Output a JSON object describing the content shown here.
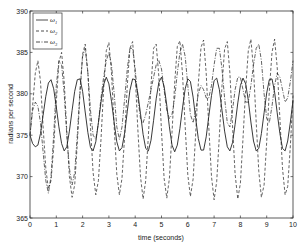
{
  "chart_data": {
    "type": "line",
    "title": "",
    "xlabel": "time (seconds)",
    "ylabel": "radians per second",
    "xlim": [
      0,
      10
    ],
    "ylim": [
      365,
      390
    ],
    "xticks": [
      0,
      1,
      2,
      3,
      4,
      5,
      6,
      7,
      8,
      9,
      10
    ],
    "yticks": [
      365,
      370,
      375,
      380,
      385,
      390
    ],
    "grid": false,
    "legend_position": "upper left",
    "x": [
      0.0,
      0.1,
      0.2,
      0.3,
      0.4,
      0.5,
      0.6,
      0.7,
      0.8,
      0.9,
      1.0,
      1.1,
      1.2,
      1.3,
      1.4,
      1.5,
      1.6,
      1.7,
      1.8,
      1.9,
      2.0,
      2.1,
      2.2,
      2.3,
      2.4,
      2.5,
      2.6,
      2.7,
      2.8,
      2.9,
      3.0,
      3.1,
      3.2,
      3.3,
      3.4,
      3.5,
      3.6,
      3.7,
      3.8,
      3.9,
      4.0,
      4.1,
      4.2,
      4.3,
      4.4,
      4.5,
      4.6,
      4.7,
      4.8,
      4.9,
      5.0,
      5.1,
      5.2,
      5.3,
      5.4,
      5.5,
      5.6,
      5.7,
      5.8,
      5.9,
      6.0,
      6.1,
      6.2,
      6.3,
      6.4,
      6.5,
      6.6,
      6.7,
      6.8,
      6.9,
      7.0,
      7.1,
      7.2,
      7.3,
      7.4,
      7.5,
      7.6,
      7.7,
      7.8,
      7.9,
      8.0,
      8.1,
      8.2,
      8.3,
      8.4,
      8.5,
      8.6,
      8.7,
      8.8,
      8.9,
      9.0,
      9.1,
      9.2,
      9.3,
      9.4,
      9.5,
      9.6,
      9.7,
      9.8,
      9.9,
      10.0
    ],
    "series": [
      {
        "name": "ω1",
        "style": "solid",
        "values": [
          375.0,
          374.0,
          373.6,
          373.8,
          375.2,
          377.4,
          379.7,
          381.3,
          381.7,
          380.6,
          378.4,
          376.0,
          374.0,
          373.1,
          373.6,
          375.5,
          378.0,
          380.3,
          381.7,
          381.8,
          380.3,
          377.8,
          375.3,
          373.5,
          373.1,
          374.2,
          376.5,
          379.0,
          381.1,
          382.0,
          381.2,
          379.1,
          376.5,
          374.2,
          373.1,
          373.5,
          375.3,
          377.9,
          380.4,
          381.8,
          381.7,
          380.1,
          377.6,
          375.1,
          373.4,
          373.1,
          374.4,
          376.8,
          379.4,
          381.4,
          382.0,
          380.9,
          378.6,
          376.0,
          373.8,
          373.0,
          373.8,
          375.8,
          378.3,
          380.6,
          381.8,
          381.5,
          379.6,
          377.0,
          374.6,
          373.2,
          373.2,
          374.8,
          377.3,
          379.8,
          381.6,
          381.9,
          380.5,
          378.0,
          375.5,
          373.6,
          373.1,
          374.1,
          376.3,
          378.9,
          381.0,
          381.9,
          381.2,
          379.2,
          376.6,
          374.3,
          373.1,
          373.4,
          375.2,
          377.7,
          380.1,
          381.7,
          381.8,
          380.2,
          377.7,
          375.2,
          373.4,
          373.1,
          374.3,
          376.6,
          379.2
        ]
      },
      {
        "name": "ω2",
        "style": "dashed",
        "values": [
          375.0,
          378.5,
          382.5,
          384.0,
          381.5,
          376.0,
          371.0,
          368.5,
          369.5,
          373.5,
          379.0,
          383.8,
          385.0,
          381.5,
          375.5,
          370.0,
          367.5,
          369.0,
          374.0,
          380.0,
          384.8,
          386.0,
          382.5,
          376.0,
          370.5,
          367.8,
          369.5,
          374.5,
          380.5,
          385.2,
          386.2,
          382.5,
          376.0,
          370.3,
          367.8,
          369.8,
          375.0,
          381.0,
          385.5,
          386.3,
          382.3,
          375.8,
          370.0,
          367.3,
          369.5,
          375.0,
          381.0,
          385.5,
          386.0,
          382.0,
          375.5,
          369.8,
          367.4,
          369.8,
          375.3,
          381.3,
          385.7,
          386.4,
          382.4,
          376.0,
          370.2,
          367.6,
          369.7,
          375.2,
          381.2,
          385.6,
          386.5,
          382.5,
          376.0,
          370.0,
          367.2,
          369.4,
          375.0,
          381.0,
          385.4,
          386.3,
          382.5,
          376.2,
          370.3,
          367.3,
          369.2,
          374.6,
          380.6,
          385.2,
          386.6,
          383.0,
          376.6,
          370.6,
          367.5,
          369.0,
          374.2,
          380.3,
          385.0,
          386.6,
          383.2,
          377.0,
          371.0,
          367.8,
          368.8,
          373.8,
          379.8
        ]
      },
      {
        "name": "ω3",
        "style": "dashdot",
        "values": [
          375.0,
          378.0,
          379.0,
          378.5,
          376.5,
          373.0,
          369.5,
          368.0,
          370.0,
          375.0,
          381.0,
          384.0,
          383.5,
          380.0,
          375.0,
          371.0,
          369.0,
          370.5,
          375.0,
          380.5,
          384.5,
          385.5,
          382.5,
          378.0,
          375.0,
          374.5,
          376.5,
          379.5,
          382.0,
          384.0,
          385.0,
          383.5,
          380.0,
          376.0,
          374.5,
          376.0,
          379.5,
          383.0,
          385.5,
          385.5,
          383.0,
          379.5,
          377.0,
          376.5,
          377.5,
          379.0,
          380.5,
          382.0,
          383.5,
          384.0,
          383.0,
          380.5,
          378.0,
          377.0,
          377.5,
          379.5,
          382.5,
          385.0,
          386.0,
          384.5,
          381.0,
          377.5,
          376.5,
          378.0,
          380.0,
          381.0,
          380.5,
          379.5,
          379.5,
          381.0,
          383.5,
          385.5,
          385.5,
          383.0,
          379.5,
          376.5,
          376.0,
          378.0,
          380.5,
          382.0,
          382.0,
          380.5,
          379.0,
          379.0,
          381.0,
          383.5,
          385.5,
          386.0,
          384.0,
          380.0,
          377.0,
          376.5,
          378.5,
          381.0,
          382.5,
          382.0,
          380.5,
          379.0,
          379.5,
          381.5,
          384.0
        ]
      }
    ]
  },
  "legend": {
    "items": [
      {
        "label": "ω",
        "sub": "1",
        "style": "solid"
      },
      {
        "label": "ω",
        "sub": "2",
        "style": "dashed"
      },
      {
        "label": "ω",
        "sub": "3",
        "style": "dashdot"
      }
    ]
  },
  "colors": {
    "line": "#222222",
    "axis": "#333333",
    "background": "#ffffff"
  }
}
